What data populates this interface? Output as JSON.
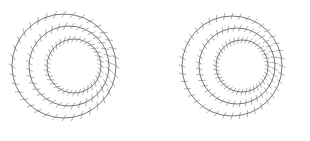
{
  "figure": {
    "background": "#ffffff",
    "stroke_color": "#555555",
    "tick_color": "#777777",
    "panels": [
      {
        "id": "left",
        "rings": [
          {
            "cx": 64,
            "cy": 66,
            "r": 52
          },
          {
            "cx": 69,
            "cy": 66,
            "r": 40
          },
          {
            "cx": 74,
            "cy": 66,
            "r": 27
          }
        ],
        "ticks_per_ring": 36,
        "tick_length": 8,
        "tick_angle_offset": 0.6
      },
      {
        "id": "right",
        "rings": [
          {
            "cx": 232,
            "cy": 66,
            "r": 50
          },
          {
            "cx": 237,
            "cy": 66,
            "r": 38
          },
          {
            "cx": 242,
            "cy": 66,
            "r": 26
          }
        ],
        "ticks_per_ring": 40,
        "tick_length": 7,
        "tick_angle_offset": 0.35
      }
    ]
  }
}
